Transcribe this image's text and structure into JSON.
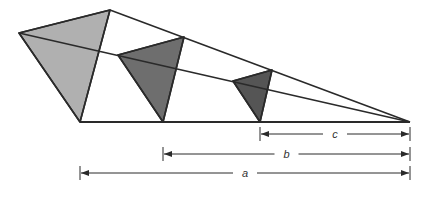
{
  "diagram": {
    "type": "geometric-similar-triangles",
    "colors": {
      "background": "#ffffff",
      "stroke": "#2a2a2a",
      "fill_large": "#b0b0b0",
      "fill_medium": "#6e6e6e",
      "fill_small": "#555555"
    },
    "apex": [
      410,
      122
    ],
    "baseline": {
      "x1": 80,
      "x2": 410,
      "y": 122
    },
    "triangles": [
      {
        "name": "large",
        "left": [
          19,
          33
        ],
        "top": [
          110,
          10
        ],
        "bottom": [
          80,
          122
        ]
      },
      {
        "name": "medium",
        "left": [
          118,
          55
        ],
        "top": [
          184,
          37
        ],
        "bottom": [
          163,
          122
        ]
      },
      {
        "name": "small",
        "left": [
          233,
          81
        ],
        "top": [
          272,
          70
        ],
        "bottom": [
          260,
          122
        ]
      }
    ],
    "dimensions": [
      {
        "label": "c",
        "x1": 260,
        "x2": 410,
        "y": 134
      },
      {
        "label": "b",
        "x1": 163,
        "x2": 410,
        "y": 154
      },
      {
        "label": "a",
        "x1": 80,
        "x2": 410,
        "y": 173
      }
    ]
  }
}
